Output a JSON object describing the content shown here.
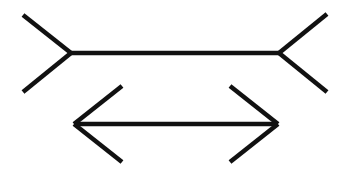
{
  "figure": {
    "title": "",
    "stroke_color": "#111111",
    "background_color": "#ffffff",
    "stroke_width": 4.5
  },
  "lines": [
    {
      "name": "fins-out-line",
      "shaft": {
        "x1": 71,
        "y1": 53,
        "x2": 279,
        "y2": 53
      },
      "left_fins": [
        {
          "x1": 71,
          "y1": 53,
          "x2": 23,
          "y2": 15
        },
        {
          "x1": 71,
          "y1": 53,
          "x2": 23,
          "y2": 92
        }
      ],
      "right_fins": [
        {
          "x1": 279,
          "y1": 53,
          "x2": 327,
          "y2": 14
        },
        {
          "x1": 279,
          "y1": 53,
          "x2": 327,
          "y2": 92
        }
      ]
    },
    {
      "name": "arrowheads-in-line",
      "shaft": {
        "x1": 74,
        "y1": 124,
        "x2": 278,
        "y2": 124
      },
      "left_fins": [
        {
          "x1": 74,
          "y1": 124,
          "x2": 122,
          "y2": 86
        },
        {
          "x1": 74,
          "y1": 124,
          "x2": 122,
          "y2": 162
        }
      ],
      "right_fins": [
        {
          "x1": 278,
          "y1": 124,
          "x2": 230,
          "y2": 86
        },
        {
          "x1": 278,
          "y1": 124,
          "x2": 230,
          "y2": 162
        }
      ]
    }
  ]
}
